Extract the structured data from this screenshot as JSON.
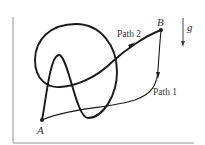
{
  "diagram": {
    "points": {
      "A": {
        "label": "A",
        "x": 42,
        "y": 120
      },
      "B": {
        "label": "B",
        "x": 161,
        "y": 30
      }
    },
    "paths": [
      {
        "name": "path-1",
        "label": "Path 1",
        "style": "thin"
      },
      {
        "name": "path-2",
        "label": "Path 2",
        "style": "thick"
      }
    ],
    "gravity": {
      "label": "g",
      "direction": "down"
    },
    "colors": {
      "stroke": "#1a1a1a",
      "frame": "#888888",
      "text": "#333333"
    }
  }
}
